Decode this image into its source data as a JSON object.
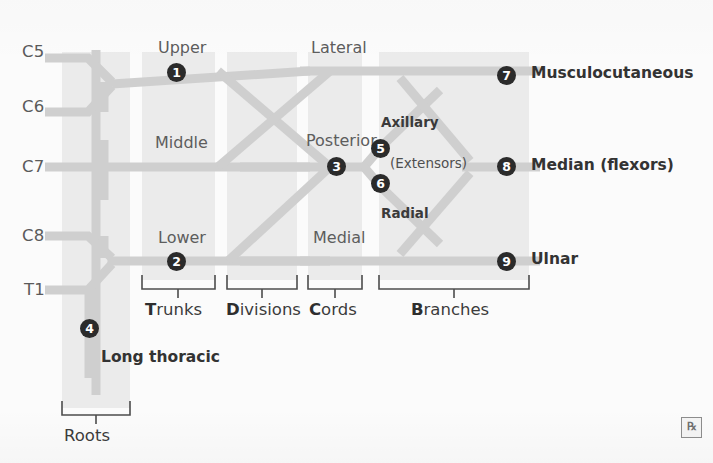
{
  "diagram": {
    "colors": {
      "nerve_path": "#cfcfcf",
      "band": "#ebebeb",
      "marker_fill": "#2b2b2b",
      "marker_text": "#ffffff",
      "label_text": "#4a4a4a",
      "background": "#fbfbfb",
      "bracket": "#4a4a4a"
    }
  },
  "roots": {
    "labels": [
      {
        "id": "root-c5",
        "text": "C5",
        "x": 22,
        "y": 42
      },
      {
        "id": "root-c6",
        "text": "C6",
        "x": 22,
        "y": 97
      },
      {
        "id": "root-c7",
        "text": "C7",
        "x": 22,
        "y": 158
      },
      {
        "id": "root-c8",
        "text": "C8",
        "x": 22,
        "y": 222
      },
      {
        "id": "root-t1",
        "text": "T1",
        "x": 24,
        "y": 278
      }
    ]
  },
  "trunks": {
    "labels": [
      {
        "id": "trunk-upper",
        "text": "Upper",
        "x": 158,
        "y": 38
      },
      {
        "id": "trunk-middle",
        "text": "Middle",
        "x": 155,
        "y": 133
      },
      {
        "id": "trunk-lower",
        "text": "Lower",
        "x": 158,
        "y": 228
      }
    ]
  },
  "cords": {
    "labels": [
      {
        "id": "cord-lateral",
        "text": "Lateral",
        "x": 311,
        "y": 38
      },
      {
        "id": "cord-posterior",
        "text": "Posterior",
        "x": 306,
        "y": 131
      },
      {
        "id": "cord-medial",
        "text": "Medial",
        "x": 313,
        "y": 228
      }
    ]
  },
  "branches": {
    "labels": [
      {
        "id": "branch-musculocutaneous",
        "text": "Musculocutaneous",
        "x": 531,
        "y": 66,
        "style": "branch-lbl"
      },
      {
        "id": "branch-median",
        "text": "Median (flexors)",
        "x": 531,
        "y": 158,
        "style": "branch-lbl"
      },
      {
        "id": "branch-ulnar",
        "text": "Ulnar",
        "x": 531,
        "y": 252,
        "style": "branch-lbl"
      },
      {
        "id": "branch-axillary",
        "text": "Axillary",
        "x": 381,
        "y": 115,
        "style": "branch-lbl-sm"
      },
      {
        "id": "branch-radial",
        "text": "Radial",
        "x": 381,
        "y": 205,
        "style": "branch-lbl-sm"
      },
      {
        "id": "branch-extensors",
        "text": "(Extensors)",
        "x": 390,
        "y": 155,
        "style": "ext-lbl"
      },
      {
        "id": "branch-long-thoracic",
        "text": "Long thoracic",
        "x": 101,
        "y": 350,
        "style": "branch-lbl"
      }
    ]
  },
  "markers": [
    {
      "n": "❶",
      "num": "1",
      "name": "marker-1-upper-trunk",
      "x": 167,
      "y": 63
    },
    {
      "n": "❷",
      "num": "2",
      "name": "marker-2-lower-trunk",
      "x": 167,
      "y": 252
    },
    {
      "n": "❸",
      "num": "3",
      "name": "marker-3-posterior-cord",
      "x": 327,
      "y": 157
    },
    {
      "n": "❹",
      "num": "4",
      "name": "marker-4-long-thoracic",
      "x": 80,
      "y": 319
    },
    {
      "n": "❺",
      "num": "5",
      "name": "marker-5-axillary",
      "x": 371,
      "y": 139
    },
    {
      "n": "❻",
      "num": "6",
      "name": "marker-6-radial",
      "x": 371,
      "y": 174
    },
    {
      "n": "❼",
      "num": "7",
      "name": "marker-7-musculocutaneous",
      "x": 497,
      "y": 66
    },
    {
      "n": "❽",
      "num": "8",
      "name": "marker-8-median",
      "x": 497,
      "y": 157
    },
    {
      "n": "❾",
      "num": "9",
      "name": "marker-9-ulnar",
      "x": 497,
      "y": 252
    }
  ],
  "stages": [
    {
      "id": "stage-trunks",
      "initial": "T",
      "rest": "runks",
      "label_x": 152,
      "label_y": 286,
      "bx1": 142,
      "bx2": 215,
      "by": 282,
      "tickx": 178
    },
    {
      "id": "stage-divisions",
      "initial": "D",
      "rest": "ivisions",
      "label_x": 227,
      "label_y": 286,
      "bx1": 227,
      "bx2": 297,
      "by": 282,
      "tickx": 262
    },
    {
      "id": "stage-cords",
      "initial": "C",
      "rest": "ords",
      "label_x": 313,
      "label_y": 286,
      "bx1": 308,
      "bx2": 362,
      "by": 282,
      "tickx": 335
    },
    {
      "id": "stage-branches",
      "initial": "B",
      "rest": "ranches",
      "label_x": 414,
      "label_y": 286,
      "bx1": 379,
      "bx2": 529,
      "by": 282,
      "tickx": 454
    },
    {
      "id": "stage-roots",
      "initial": "",
      "rest": "Roots",
      "label_x": 66,
      "label_y": 412,
      "bx1": 62,
      "bx2": 130,
      "by": 408,
      "tickx": 96
    }
  ],
  "logo": {
    "id": "rx-logo",
    "text": "℞",
    "x": 681,
    "y": 417
  }
}
